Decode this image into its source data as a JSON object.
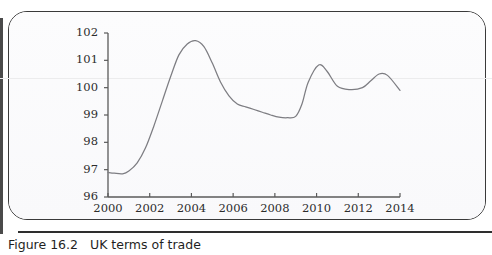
{
  "figure": {
    "caption_number": "Figure 16.2",
    "caption_text": "UK terms of trade"
  },
  "colors": {
    "line": "#7d7d82",
    "axis": "#5a5a5a",
    "text": "#2c2c2c",
    "panel_border": "#3a3a3a",
    "panel_bg": "#fbfbfc",
    "faint_gridline": "#ececed"
  },
  "chart_data": {
    "type": "line",
    "title": "UK terms of trade",
    "xlabel": "",
    "ylabel": "",
    "xlim": [
      2000,
      2014
    ],
    "ylim": [
      96,
      102
    ],
    "grid": false,
    "legend": null,
    "xticks": [
      "2000",
      "2002",
      "2004",
      "2006",
      "2008",
      "2010",
      "2012",
      "2014"
    ],
    "yticks": [
      "96",
      "97",
      "98",
      "99",
      "100",
      "101",
      "102"
    ],
    "series": [
      {
        "name": "UK terms of trade",
        "x": [
          2000.0,
          2000.3,
          2000.7,
          2001.0,
          2001.4,
          2001.8,
          2002.2,
          2002.6,
          2003.0,
          2003.4,
          2003.8,
          2004.2,
          2004.6,
          2005.0,
          2005.4,
          2005.8,
          2006.2,
          2006.6,
          2007.0,
          2007.4,
          2007.8,
          2008.2,
          2008.6,
          2009.0,
          2009.3,
          2009.6,
          2010.1,
          2010.5,
          2011.0,
          2011.6,
          2012.2,
          2012.6,
          2013.0,
          2013.4,
          2014.0
        ],
        "values": [
          96.9,
          96.87,
          96.85,
          96.95,
          97.25,
          97.8,
          98.6,
          99.5,
          100.4,
          101.2,
          101.6,
          101.72,
          101.5,
          100.9,
          100.2,
          99.7,
          99.4,
          99.3,
          99.2,
          99.1,
          99.0,
          98.92,
          98.9,
          98.95,
          99.4,
          100.2,
          100.83,
          100.6,
          100.05,
          99.93,
          100.0,
          100.25,
          100.5,
          100.45,
          99.9
        ]
      }
    ]
  },
  "axes_geometry": {
    "origin_x_px": 108,
    "origin_y_px": 197,
    "x_end_px": 400,
    "y_top_px": 33,
    "px_per_year": 20.857,
    "px_per_unit": 27.333
  }
}
